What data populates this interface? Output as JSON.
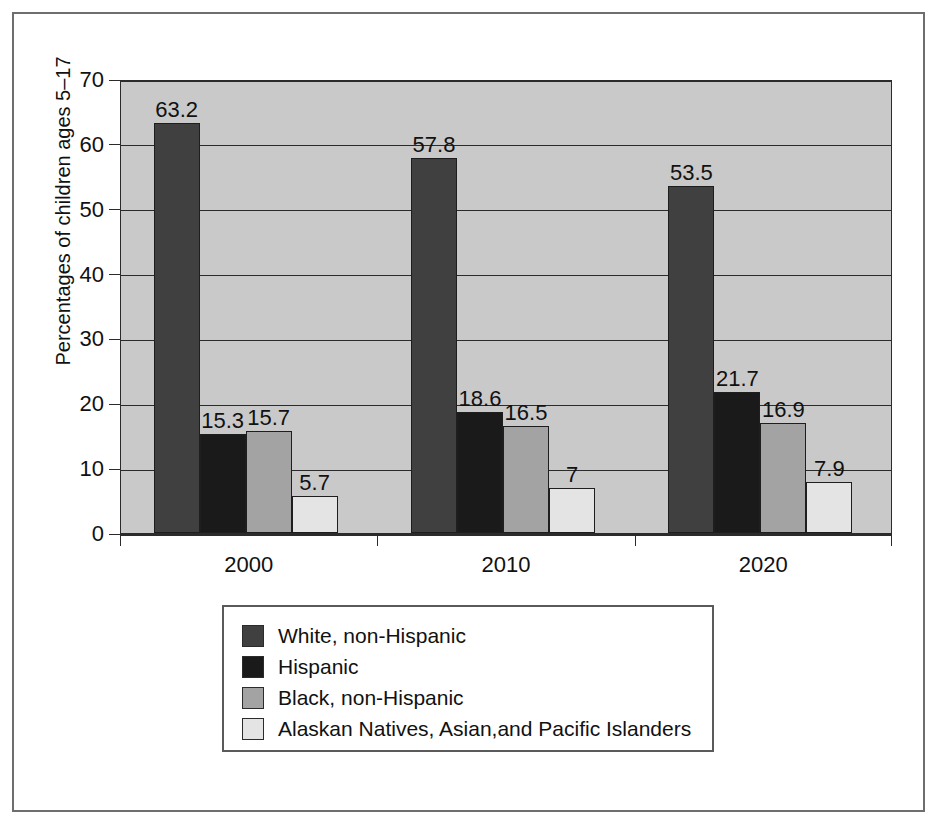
{
  "chart_data": {
    "type": "bar",
    "title": "",
    "subtitle": "",
    "xlabel": "",
    "ylabel": "Percentages of children ages 5–17",
    "categories": [
      "2000",
      "2010",
      "2020"
    ],
    "ylim": [
      0,
      70
    ],
    "yticks": [
      0,
      10,
      20,
      30,
      40,
      50,
      60,
      70
    ],
    "ytick_labels": [
      "0",
      "10",
      "20",
      "30",
      "40",
      "50",
      "60",
      "70"
    ],
    "grid": true,
    "grid_axis": "y",
    "legend_position": "bottom-center",
    "series": [
      {
        "name": "White, non-Hispanic",
        "color": "#404040",
        "values": [
          63.2,
          57.8,
          53.5
        ],
        "labels": [
          "63.2",
          "57.8",
          "53.5"
        ]
      },
      {
        "name": "Hispanic",
        "color": "#1a1a1a",
        "values": [
          15.3,
          18.6,
          21.7
        ],
        "labels": [
          "15.3",
          "18.6",
          "21.7"
        ]
      },
      {
        "name": "Black, non-Hispanic",
        "color": "#a3a3a3",
        "values": [
          15.7,
          16.5,
          16.9
        ],
        "labels": [
          "15.7",
          "16.5",
          "16.9"
        ]
      },
      {
        "name": "Alaskan Natives, Asian,and Pacific Islanders",
        "color": "#e4e4e4",
        "values": [
          5.7,
          7.0,
          7.9
        ],
        "labels": [
          "5.7",
          "7",
          "7.9"
        ]
      }
    ]
  },
  "style": {
    "plot_background": "#c9c9c9",
    "axis_color": "#2b2b2b",
    "frame_color": "#6e6e6e",
    "legend_border": "#5a5a5a",
    "text_color": "#111111"
  }
}
